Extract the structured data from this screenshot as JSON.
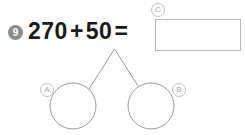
{
  "problem": {
    "number": "9",
    "equation": {
      "first_addend": "270",
      "operator": "+",
      "second_addend": "50",
      "equals": "="
    }
  },
  "answer_box": {
    "label": "C",
    "value": "",
    "placeholder": ""
  },
  "number_bond": {
    "left_circle": {
      "label": "A",
      "value": ""
    },
    "right_circle": {
      "label": "B",
      "value": ""
    }
  },
  "colors": {
    "badge_fill": "#8c8c8c",
    "badge_text": "#ffffff",
    "equation_text": "#1a1a1a",
    "box_border": "#b9b9b9",
    "line_stroke": "#9a9a9a",
    "letter_badge_border": "#c2c2c2",
    "letter_badge_text": "#a8a8a8",
    "background": "#ffffff"
  }
}
